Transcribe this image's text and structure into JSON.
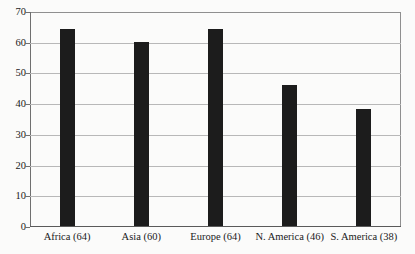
{
  "chart_data": {
    "type": "bar",
    "title": "",
    "subtitle": "",
    "xlabel": "",
    "ylabel": "",
    "categories": [
      "Africa (64)",
      "Asia (60)",
      "Europe (64)",
      "N. America (46)",
      "S. America (38)"
    ],
    "values": [
      64,
      60,
      64,
      46,
      38
    ],
    "ylim": [
      0,
      70
    ],
    "ytick_labels": [
      "0",
      "10",
      "20",
      "30",
      "40",
      "50",
      "60",
      "70"
    ],
    "ytick_values": [
      0,
      10,
      20,
      30,
      40,
      50,
      60,
      70
    ],
    "grid": true,
    "legend": false,
    "bar_color": "#1c1c1c",
    "grid_color": "#b8b8b8",
    "axis_color": "#6f6f6f",
    "background_color": "#fbfbfa"
  }
}
